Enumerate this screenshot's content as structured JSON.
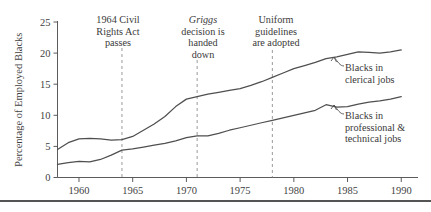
{
  "figure": {
    "background_color": "#ffffff",
    "line_color": "#4f4f4f",
    "axis_color": "#4a4a4a",
    "event_line_color": "#8f8f8f"
  },
  "axis": {
    "ylabel": "Percentage of Employed Blacks",
    "y_ticks": [
      "0",
      "5",
      "10",
      "15",
      "20",
      "25"
    ],
    "x_ticks": [
      "1960",
      "1965",
      "1970",
      "1975",
      "1980",
      "1985",
      "1990"
    ]
  },
  "annotations": [
    {
      "name": "civil-rights-act",
      "lines": [
        "1964 Civil",
        "Rights Act",
        "passes"
      ],
      "year": 1964
    },
    {
      "name": "griggs-decision",
      "lines": [
        "Griggs",
        "decision is",
        "handed",
        "down"
      ],
      "italic_first_line": true,
      "year": 1971
    },
    {
      "name": "uniform-guidelines",
      "lines": [
        "Uniform",
        "guidelines",
        "are adopted"
      ],
      "year": 1978
    }
  ],
  "series_labels": [
    {
      "name": "clerical",
      "lines": [
        "Blacks in",
        "clerical jobs"
      ]
    },
    {
      "name": "professional",
      "lines": [
        "Blacks in",
        "professional &",
        "technical jobs"
      ]
    }
  ],
  "chart_data": {
    "type": "line",
    "title": "",
    "xlabel": "",
    "ylabel": "Percentage of Employed Blacks",
    "xlim": [
      1958,
      1991
    ],
    "ylim": [
      0,
      25
    ],
    "grid": false,
    "legend": "inline-annotations",
    "x": [
      1958,
      1959,
      1960,
      1961,
      1962,
      1963,
      1964,
      1965,
      1966,
      1967,
      1968,
      1969,
      1970,
      1971,
      1972,
      1973,
      1974,
      1975,
      1976,
      1977,
      1978,
      1979,
      1980,
      1981,
      1982,
      1983,
      1984,
      1985,
      1986,
      1987,
      1988,
      1989,
      1990
    ],
    "series": [
      {
        "name": "Blacks in clerical jobs",
        "values": [
          4.5,
          5.6,
          6.2,
          6.3,
          6.2,
          6.0,
          6.1,
          6.6,
          7.6,
          8.6,
          9.8,
          11.4,
          12.6,
          13.0,
          13.4,
          13.7,
          14.0,
          14.3,
          14.8,
          15.4,
          16.1,
          16.8,
          17.5,
          18.0,
          18.5,
          19.1,
          19.4,
          19.8,
          20.2,
          20.1,
          20.0,
          20.2,
          20.5
        ]
      },
      {
        "name": "Blacks in professional & technical jobs",
        "values": [
          2.1,
          2.4,
          2.6,
          2.5,
          2.9,
          3.6,
          4.4,
          4.6,
          4.9,
          5.2,
          5.5,
          5.9,
          6.4,
          6.7,
          6.7,
          7.1,
          7.6,
          8.0,
          8.4,
          8.8,
          9.2,
          9.6,
          10.0,
          10.4,
          10.8,
          11.7,
          11.3,
          11.4,
          11.8,
          12.1,
          12.3,
          12.6,
          13.0
        ]
      }
    ],
    "events": [
      {
        "label": "1964 Civil Rights Act passes",
        "year": 1964
      },
      {
        "label": "Griggs decision is handed down",
        "year": 1971
      },
      {
        "label": "Uniform guidelines are adopted",
        "year": 1978
      }
    ]
  }
}
